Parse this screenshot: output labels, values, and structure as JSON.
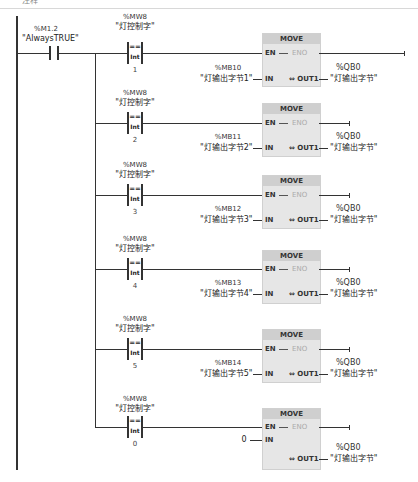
{
  "header": {
    "caption": "注释"
  },
  "contact": {
    "address": "%M1.2",
    "symbol": "\"AlwaysTRUE\""
  },
  "rungs": [
    {
      "compare": {
        "address": "%MW8",
        "symbol": "\"灯控制字\"",
        "operator": "==",
        "type": "Int",
        "value": "1"
      },
      "move": {
        "title": "MOVE",
        "en": "EN",
        "eno": "ENO",
        "in": "IN",
        "out": "OUT1",
        "in_address": "%MB10",
        "in_symbol": "\"灯输出字节1\"",
        "out_address": "%QB0",
        "out_symbol": "\"灯输出字节\""
      }
    },
    {
      "compare": {
        "address": "%MW8",
        "symbol": "\"灯控制字\"",
        "operator": "==",
        "type": "Int",
        "value": "2"
      },
      "move": {
        "title": "MOVE",
        "en": "EN",
        "eno": "ENO",
        "in": "IN",
        "out": "OUT1",
        "in_address": "%MB11",
        "in_symbol": "\"灯输出字节2\"",
        "out_address": "%QB0",
        "out_symbol": "\"灯输出字节\""
      }
    },
    {
      "compare": {
        "address": "%MW8",
        "symbol": "\"灯控制字\"",
        "operator": "==",
        "type": "Int",
        "value": "3"
      },
      "move": {
        "title": "MOVE",
        "en": "EN",
        "eno": "ENO",
        "in": "IN",
        "out": "OUT1",
        "in_address": "%MB12",
        "in_symbol": "\"灯输出字节3\"",
        "out_address": "%QB0",
        "out_symbol": "\"灯输出字节\""
      }
    },
    {
      "compare": {
        "address": "%MW8",
        "symbol": "\"灯控制字\"",
        "operator": "==",
        "type": "Int",
        "value": "4"
      },
      "move": {
        "title": "MOVE",
        "en": "EN",
        "eno": "ENO",
        "in": "IN",
        "out": "OUT1",
        "in_address": "%MB13",
        "in_symbol": "\"灯输出字节4\"",
        "out_address": "%QB0",
        "out_symbol": "\"灯输出字节\""
      }
    },
    {
      "compare": {
        "address": "%MW8",
        "symbol": "\"灯控制字\"",
        "operator": "==",
        "type": "Int",
        "value": "5"
      },
      "move": {
        "title": "MOVE",
        "en": "EN",
        "eno": "ENO",
        "in": "IN",
        "out": "OUT1",
        "in_address": "%MB14",
        "in_symbol": "\"灯输出字节5\"",
        "out_address": "%QB0",
        "out_symbol": "\"灯输出字节\""
      }
    },
    {
      "compare": {
        "address": "%MW8",
        "symbol": "\"灯控制字\"",
        "operator": "==",
        "type": "Int",
        "value": "0"
      },
      "move": {
        "title": "MOVE",
        "en": "EN",
        "eno": "ENO",
        "in": "IN",
        "out": "OUT1",
        "in_value": "0",
        "out_address": "%QB0",
        "out_symbol": "\"灯输出字节\""
      }
    }
  ]
}
